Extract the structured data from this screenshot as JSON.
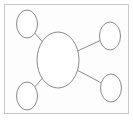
{
  "diagram": {
    "type": "mind-map",
    "colors": {
      "stroke": "#8a8a8a",
      "frame": "#c8c8c8",
      "fill": "#ffffff"
    },
    "central_node": {
      "id": "center",
      "label": ""
    },
    "nodes": [
      {
        "id": "top-left",
        "label": ""
      },
      {
        "id": "bottom-left",
        "label": ""
      },
      {
        "id": "top-right",
        "label": ""
      },
      {
        "id": "bottom-right",
        "label": ""
      }
    ],
    "edges": [
      {
        "from": "center",
        "to": "top-left"
      },
      {
        "from": "center",
        "to": "bottom-left"
      },
      {
        "from": "center",
        "to": "top-right"
      },
      {
        "from": "center",
        "to": "bottom-right"
      }
    ]
  }
}
